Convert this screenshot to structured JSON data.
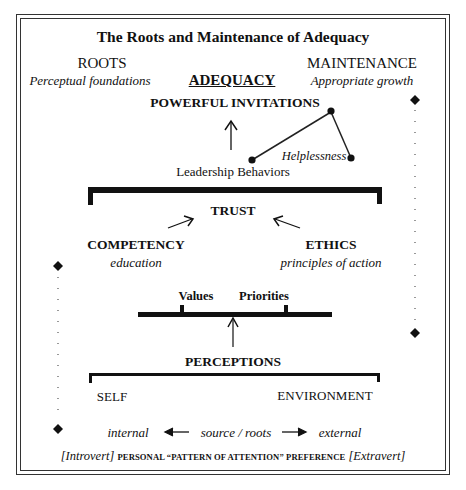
{
  "diagram": {
    "title": "The Roots and Maintenance of Adequacy",
    "roots": {
      "heading": "ROOTS",
      "subtitle": "Perceptual foundations"
    },
    "center": {
      "heading": "ADEQUACY"
    },
    "maintenance": {
      "heading": "MAINTENANCE",
      "subtitle": "Appropriate growth"
    },
    "top_node": "POWERFUL INVITATIONS",
    "leadership": "Leadership Behaviors",
    "helplessness": "Helplessness",
    "trust": "TRUST",
    "competency": {
      "heading": "COMPETENCY",
      "subtitle": "education"
    },
    "ethics": {
      "heading": "ETHICS",
      "subtitle": "principles of action"
    },
    "balance": {
      "left": "Values",
      "right": "Priorities"
    },
    "perceptions": "PERCEPTIONS",
    "self": "SELF",
    "environment": "ENVIRONMENT",
    "axis": {
      "left": "internal",
      "middle": "source / roots",
      "right": "external"
    },
    "footer": {
      "left": "[Introvert]",
      "middle": "PERSONAL “PATTERN OF ATTENTION” PREFERENCE",
      "right": "[Extravert]"
    }
  }
}
